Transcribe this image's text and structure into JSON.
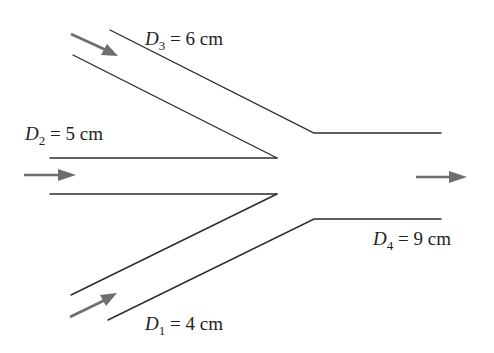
{
  "diagram": {
    "type": "pipe-junction",
    "colors": {
      "pipe_wall": "#2b2b2b",
      "flow_arrow": "#6e6e6e",
      "background": "#ffffff"
    },
    "pipes": [
      {
        "id": "pipe-1",
        "role": "inlet",
        "label": {
          "var": "D",
          "sub": "1",
          "rest": " = 4 cm"
        },
        "diameter_cm": 4,
        "direction": "up-right"
      },
      {
        "id": "pipe-2",
        "role": "inlet",
        "label": {
          "var": "D",
          "sub": "2",
          "rest": " = 5 cm"
        },
        "diameter_cm": 5,
        "direction": "right"
      },
      {
        "id": "pipe-3",
        "role": "inlet",
        "label": {
          "var": "D",
          "sub": "3",
          "rest": " = 6 cm"
        },
        "diameter_cm": 6,
        "direction": "down-right"
      },
      {
        "id": "pipe-4",
        "role": "outlet",
        "label": {
          "var": "D",
          "sub": "4",
          "rest": " = 9 cm"
        },
        "diameter_cm": 9,
        "direction": "right"
      }
    ],
    "flow_arrows": [
      {
        "id": "arrow-pipe-3",
        "label": "flow-in-pipe-3"
      },
      {
        "id": "arrow-pipe-2",
        "label": "flow-in-pipe-2"
      },
      {
        "id": "arrow-pipe-1",
        "label": "flow-in-pipe-1"
      },
      {
        "id": "arrow-pipe-4",
        "label": "flow-out-pipe-4"
      }
    ]
  }
}
